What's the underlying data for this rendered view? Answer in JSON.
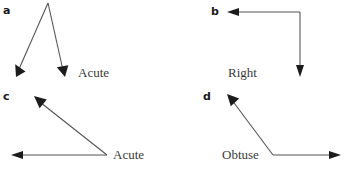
{
  "figure": {
    "width": 348,
    "height": 169,
    "background_color": "#ffffff",
    "line_color": "#555555",
    "arrow_color": "#1c1c1c",
    "label_color": "#3a3a3a",
    "panel_label_color": "#1a1a1a"
  },
  "panels": [
    {
      "id": "a",
      "label": "a",
      "label_pos": {
        "x": 3,
        "y": 5
      },
      "angle_label": "Acute",
      "angle_label_pos": {
        "x": 78,
        "y": 66
      },
      "vertex": {
        "x": 48,
        "y": 3
      },
      "rays": [
        {
          "name": "ray-down-left",
          "to": {
            "x": 16,
            "y": 76
          }
        },
        {
          "name": "ray-down-right",
          "to": {
            "x": 65,
            "y": 76
          }
        }
      ]
    },
    {
      "id": "b",
      "label": "b",
      "label_pos": {
        "x": 211,
        "y": 6
      },
      "angle_label": "Right",
      "angle_label_pos": {
        "x": 228,
        "y": 66
      },
      "vertex": {
        "x": 300,
        "y": 12
      },
      "rays": [
        {
          "name": "ray-left",
          "to": {
            "x": 228,
            "y": 12
          }
        },
        {
          "name": "ray-down",
          "to": {
            "x": 300,
            "y": 76
          }
        }
      ]
    },
    {
      "id": "c",
      "label": "c",
      "label_pos": {
        "x": 3,
        "y": 91
      },
      "angle_label": "Acute",
      "angle_label_pos": {
        "x": 113,
        "y": 148
      },
      "vertex": {
        "x": 107,
        "y": 155
      },
      "rays": [
        {
          "name": "ray-left",
          "to": {
            "x": 12,
            "y": 155
          }
        },
        {
          "name": "ray-up-left",
          "to": {
            "x": 35,
            "y": 96
          }
        }
      ]
    },
    {
      "id": "d",
      "label": "d",
      "label_pos": {
        "x": 203,
        "y": 91
      },
      "angle_label": "Obtuse",
      "angle_label_pos": {
        "x": 222,
        "y": 148
      },
      "vertex": {
        "x": 273,
        "y": 155
      },
      "rays": [
        {
          "name": "ray-right",
          "to": {
            "x": 340,
            "y": 155
          }
        },
        {
          "name": "ray-up-left",
          "to": {
            "x": 228,
            "y": 95
          }
        }
      ]
    }
  ]
}
